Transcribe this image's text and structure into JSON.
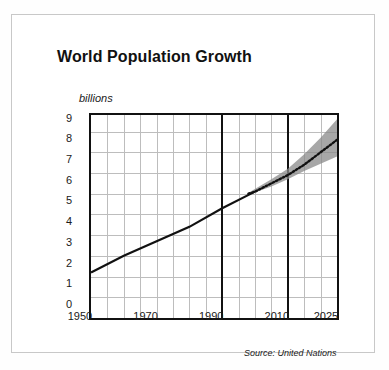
{
  "chart_data": {
    "type": "line",
    "title": "World Population Growth",
    "subtitle": "",
    "xlabel": "",
    "ylabel": "billions",
    "unit_label": "billions",
    "source": "Source: United Nations",
    "xlim": [
      1950,
      2025
    ],
    "ylim": [
      0,
      9.8
    ],
    "grid": true,
    "legend": "none",
    "x_ticks": [
      "1950",
      "1970",
      "1990",
      "2010",
      "2025"
    ],
    "x_tick_values": [
      1950,
      1970,
      1990,
      2010,
      2025
    ],
    "y_ticks": [
      "0",
      "1",
      "2",
      "3",
      "4",
      "5",
      "6",
      "7",
      "8",
      "9"
    ],
    "y_tick_values": [
      0,
      1,
      2,
      3,
      4,
      5,
      6,
      7,
      8,
      9
    ],
    "x_minor_gridlines": [
      1955,
      1960,
      1965,
      1975,
      1980,
      1985,
      1995,
      2000,
      2005,
      2015,
      2020
    ],
    "x_thick_dividers": [
      1990,
      2010
    ],
    "series": [
      {
        "name": "Historical population",
        "style": "solid",
        "color": "#111111",
        "x": [
          1950,
          1960,
          1970,
          1980,
          1990,
          2000
        ],
        "values": [
          2.2,
          3.0,
          3.7,
          4.4,
          5.3,
          6.1
        ]
      },
      {
        "name": "Projected population (medium variant)",
        "style": "dotted",
        "color": "#111111",
        "x": [
          1998,
          2000,
          2005,
          2010,
          2015,
          2020,
          2025
        ],
        "values": [
          6.0,
          6.1,
          6.5,
          6.9,
          7.4,
          8.0,
          8.6
        ]
      }
    ],
    "uncertainty_band": {
      "name": "Projection range (high / low variants)",
      "color": "#8a8a8a",
      "opacity": 0.75,
      "x": [
        1998,
        2005,
        2010,
        2015,
        2020,
        2025
      ],
      "upper": [
        6.05,
        6.7,
        7.2,
        7.9,
        8.7,
        9.6
      ],
      "lower": [
        5.95,
        6.35,
        6.7,
        7.1,
        7.45,
        7.8
      ]
    },
    "annotations": []
  },
  "chart": {
    "title": "World Population Growth",
    "unit": "billions",
    "source": "Source: United Nations"
  }
}
